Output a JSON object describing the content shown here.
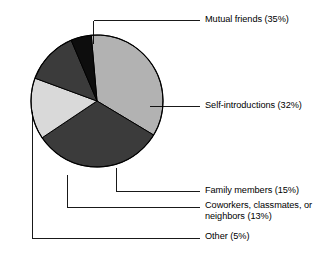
{
  "chart_data": {
    "type": "pie",
    "title": "",
    "subtitle": "",
    "xlabel": "",
    "ylabel": "",
    "grid": false,
    "legend_position": "callout-labels-right",
    "units": "percent",
    "start_angle_deg": -5,
    "direction": "clockwise",
    "categories": [
      "Mutual friends",
      "Self-introductions",
      "Family members",
      "Coworkers, classmates, or neighbors",
      "Other"
    ],
    "values": [
      35,
      32,
      15,
      13,
      5
    ],
    "labels": [
      "Mutual friends (35%)",
      "Self-introductions (32%)",
      "Family members (15%)",
      "Coworkers, classmates, or neighbors (13%)",
      "Other (5%)"
    ],
    "colors": [
      "#b2b2b2",
      "#3b3b3b",
      "#d9d9d9",
      "#3b3b3b",
      "#0d0d0d"
    ],
    "slices": [
      {
        "name": "Mutual friends",
        "value": 35,
        "label": "Mutual friends (35%)",
        "color": "#b2b2b2"
      },
      {
        "name": "Self-introductions",
        "value": 32,
        "label": "Self-introductions (32%)",
        "color": "#3b3b3b"
      },
      {
        "name": "Family members",
        "value": 15,
        "label": "Family members (15%)",
        "color": "#d9d9d9"
      },
      {
        "name": "Coworkers, classmates, or neighbors",
        "value": 13,
        "label": "Coworkers, classmates, or neighbors (13%)",
        "color": "#3b3b3b"
      },
      {
        "name": "Other",
        "value": 5,
        "label": "Other (5%)",
        "color": "#0d0d0d"
      }
    ]
  },
  "labels": {
    "mutual_friends": "Mutual friends (35%)",
    "self_introductions": "Self-introductions (32%)",
    "family_members": "Family members (15%)",
    "coworkers": "Coworkers, classmates, or neighbors (13%)",
    "other": "Other (5%)"
  },
  "style": {
    "background": "#ffffff",
    "outline": "#000000",
    "leader_line": "#000000"
  }
}
